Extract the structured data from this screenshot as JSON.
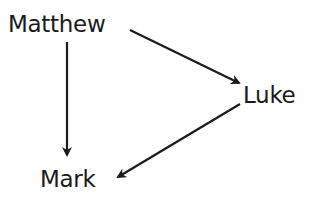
{
  "diagram": {
    "type": "directed-graph",
    "nodes": [
      {
        "id": "matthew",
        "label": "Matthew"
      },
      {
        "id": "luke",
        "label": "Luke"
      },
      {
        "id": "mark",
        "label": "Mark"
      }
    ],
    "edges": [
      {
        "from": "matthew",
        "to": "luke"
      },
      {
        "from": "matthew",
        "to": "mark"
      },
      {
        "from": "luke",
        "to": "mark"
      }
    ],
    "colors": {
      "text": "#1a1a1a",
      "arrow": "#1a1a1a",
      "background": "#ffffff"
    }
  }
}
